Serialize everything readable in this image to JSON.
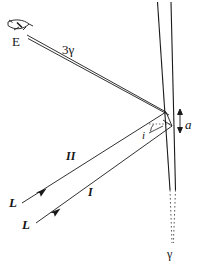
{
  "figure": {
    "title": "thin-film interference ray diagram",
    "background_color": "#ffffff",
    "line_color": "#1a1a1a",
    "labels": {
      "eye": "E",
      "reflected_rays": "3γ",
      "film_thickness": "a",
      "angle_of_incidence": "i",
      "ray_two": "II",
      "ray_one": "I",
      "source_upper": "L",
      "source_lower": "L",
      "transmitted": "γ"
    },
    "icons": {
      "eye": "eye-icon",
      "arrowhead_ray_one": "arrowhead-icon",
      "arrowhead_ray_two": "arrowhead-icon",
      "thickness_arrow": "double-arrow-icon"
    },
    "geometry": {
      "film_front_line": {
        "x1": 158,
        "y1": 2,
        "x2": 170,
        "y2": 190
      },
      "film_back_line": {
        "x1": 171,
        "y1": 2,
        "x2": 175,
        "y2": 190
      },
      "dotted_continuation": {
        "x1": 170,
        "y1": 190,
        "x2": 173,
        "y2": 244
      },
      "reflection_point_upper": {
        "x": 166,
        "y": 112
      },
      "reflection_point_lower": {
        "x": 163,
        "y": 126
      },
      "eye_point": {
        "x": 26,
        "y": 33
      },
      "source_one": {
        "x": 36,
        "y": 222
      },
      "source_two": {
        "x": 22,
        "y": 202
      }
    }
  }
}
